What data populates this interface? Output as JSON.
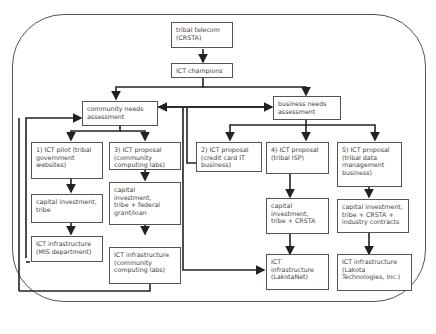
{
  "diagram": {
    "nodes": [
      {
        "id": "telecom",
        "label": "tribal telecom\n(CRSTA)"
      },
      {
        "id": "champions",
        "label": "ICT champions"
      },
      {
        "id": "community",
        "label": "community needs\nassessment"
      },
      {
        "id": "business",
        "label": "business needs\nassessment"
      },
      {
        "id": "p1",
        "label": "1) ICT pilot (tribal\ngovernment\nwebsites)"
      },
      {
        "id": "p3",
        "label": "3) ICT proposal\n(community\ncomputing labs)"
      },
      {
        "id": "p2",
        "label": "2) ICT proposal\n(credit card IT\nbusiness)"
      },
      {
        "id": "p4",
        "label": "4) ICT proposal\n(tribal ISP)"
      },
      {
        "id": "p5",
        "label": "5) ICT proposal\n(tribal data\nmanagement\nbusiness)"
      },
      {
        "id": "c1",
        "label": "capital investment,\ntribe"
      },
      {
        "id": "c3",
        "label": "capital\ninvestment,\ntribe + federal\ngrant/loan"
      },
      {
        "id": "c4",
        "label": "capital\ninvestment,\ntribe + CRSTA"
      },
      {
        "id": "c5",
        "label": "capital investment,\ntribe + CRSTA +\nindustry contracts"
      },
      {
        "id": "i1",
        "label": "ICT infrastructure\n(MIS department)"
      },
      {
        "id": "i3",
        "label": "ICT infrastructure\n(community\ncomputing labs)"
      },
      {
        "id": "i4",
        "label": "ICT\ninfrastructure\n(LakotaNet)"
      },
      {
        "id": "i5",
        "label": "ICT infrastructure\n(Lakota\nTechnologies, Inc.)"
      }
    ],
    "edges": [
      [
        "telecom",
        "champions"
      ],
      [
        "champions",
        "community"
      ],
      [
        "champions",
        "business"
      ],
      [
        "community",
        "business"
      ],
      [
        "business",
        "community"
      ],
      [
        "community",
        "p1"
      ],
      [
        "community",
        "p3"
      ],
      [
        "business",
        "p2"
      ],
      [
        "business",
        "p4"
      ],
      [
        "business",
        "p5"
      ],
      [
        "p1",
        "c1"
      ],
      [
        "c1",
        "i1"
      ],
      [
        "p3",
        "c3"
      ],
      [
        "c3",
        "i3"
      ],
      [
        "p4",
        "c4"
      ],
      [
        "c4",
        "i4"
      ],
      [
        "p5",
        "c5"
      ],
      [
        "c5",
        "i5"
      ],
      [
        "i1",
        "community"
      ],
      [
        "i3",
        "community"
      ],
      [
        "p2",
        "community"
      ],
      [
        "community",
        "i4"
      ]
    ],
    "colors": {
      "line": "#222222",
      "box_border": "#555555",
      "text": "#444444"
    }
  }
}
